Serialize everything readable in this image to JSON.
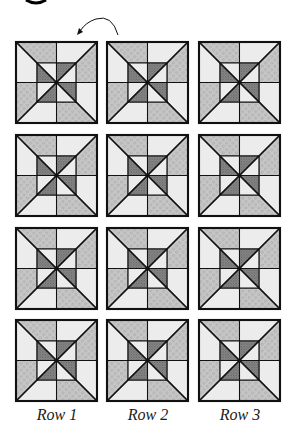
{
  "figure": {
    "rotation_arrow": {
      "direction": "counterclockwise",
      "from": [
        118,
        35
      ],
      "to": [
        79,
        33
      ]
    },
    "colors": {
      "background": "#ffffff",
      "outline": "#111111",
      "light_fabric": "#ececec",
      "floral_fabric_base": "#c8c8c8",
      "floral_fabric_pattern": "#9a9a9a",
      "check_fabric_base": "#8e8e8e",
      "check_fabric_pattern": "#5a5a5a"
    },
    "grid": {
      "columns_x": [
        16,
        107,
        199
      ],
      "rows_y": [
        42,
        135,
        228,
        320
      ],
      "block_size": 81
    },
    "block": {
      "outer_pieces": [
        {
          "position": "top-left-top",
          "fabric": "floral"
        },
        {
          "position": "top-left-left",
          "fabric": "light"
        },
        {
          "position": "top-right-top",
          "fabric": "light"
        },
        {
          "position": "top-right-right",
          "fabric": "floral"
        },
        {
          "position": "bottom-right-right",
          "fabric": "light"
        },
        {
          "position": "bottom-right-bottom",
          "fabric": "floral"
        },
        {
          "position": "bottom-left-bottom",
          "fabric": "light"
        },
        {
          "position": "bottom-left-left",
          "fabric": "floral"
        }
      ],
      "inner_pieces": [
        {
          "position": "tl-upper",
          "fabric": "light"
        },
        {
          "position": "tl-lower",
          "fabric": "check"
        },
        {
          "position": "tr-upper",
          "fabric": "check"
        },
        {
          "position": "tr-lower",
          "fabric": "light"
        },
        {
          "position": "br-upper",
          "fabric": "check"
        },
        {
          "position": "br-lower",
          "fabric": "light"
        },
        {
          "position": "bl-upper",
          "fabric": "light"
        },
        {
          "position": "bl-lower",
          "fabric": "check"
        }
      ]
    },
    "column_labels": [
      "Row 1",
      "Row 2",
      "Row 3"
    ]
  }
}
